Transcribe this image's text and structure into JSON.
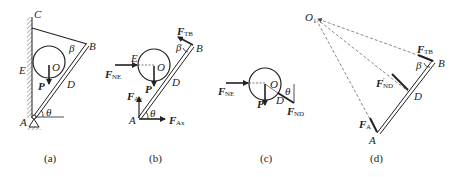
{
  "figure": {
    "panels": [
      {
        "id": "a",
        "caption": "(a)",
        "points": {
          "C": "C",
          "B": "B",
          "E": "E",
          "O": "O",
          "D": "D",
          "A": "A"
        },
        "angles": {
          "theta": "θ",
          "beta": "β"
        },
        "forces": {
          "P": "P"
        }
      },
      {
        "id": "b",
        "caption": "(b)",
        "points": {
          "E": "E",
          "O": "O",
          "B": "B",
          "D": "D",
          "A": "A"
        },
        "angles": {
          "theta": "θ",
          "beta": "β"
        },
        "forces": {
          "F_TB": {
            "main": "F",
            "sub": "TB"
          },
          "F_NE": {
            "main": "F",
            "sub": "NE"
          },
          "P": "P",
          "F_Ay": {
            "main": "F",
            "sub": "Ay"
          },
          "F_Ax": {
            "main": "F",
            "sub": "Ax"
          }
        }
      },
      {
        "id": "c",
        "caption": "(c)",
        "points": {
          "O": "O",
          "D": "D"
        },
        "angles": {
          "theta": "θ"
        },
        "forces": {
          "F_NE": {
            "main": "F",
            "sub": "NE"
          },
          "P": "P",
          "F_ND": {
            "main": "F",
            "sub": "ND"
          }
        }
      },
      {
        "id": "d",
        "caption": "(d)",
        "points": {
          "O1": {
            "main": "O",
            "sub": "1"
          },
          "B": "B",
          "D": "D",
          "A": "A"
        },
        "angles": {
          "beta": "β"
        },
        "forces": {
          "F_TB": {
            "main": "F",
            "sub": "TB"
          },
          "F_ND_prime": {
            "main": "F",
            "prime": "′",
            "sub": "ND"
          },
          "F_A": {
            "main": "F",
            "sub": "A"
          }
        }
      }
    ]
  }
}
